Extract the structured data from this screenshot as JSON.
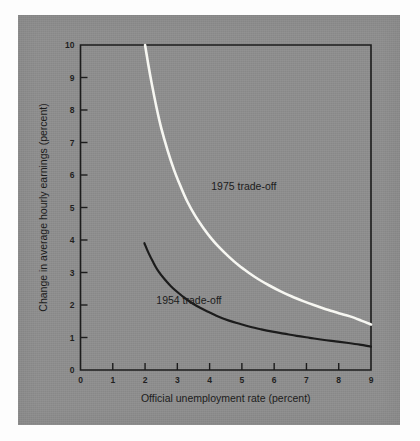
{
  "figure": {
    "panel_color": "#8e8e8e",
    "page_color": "#fdfdfd",
    "axis_color": "#1c1c1c"
  },
  "chart_data": {
    "type": "line",
    "title": "",
    "subtitle": "",
    "xlabel": "Official unemployment rate (percent)",
    "ylabel": "Change in average hourly earnings (percent)",
    "xlim": [
      0,
      9
    ],
    "ylim": [
      0,
      10
    ],
    "xticks": [
      0,
      1,
      2,
      3,
      4,
      5,
      6,
      7,
      8,
      9
    ],
    "xticklabels": [
      "0",
      "1",
      "2",
      "3",
      "4",
      "5",
      "6",
      "7",
      "8",
      "9"
    ],
    "yticks": [
      0,
      1,
      2,
      3,
      4,
      5,
      6,
      7,
      8,
      9,
      10
    ],
    "yticklabels": [
      "0",
      "1",
      "2",
      "3",
      "4",
      "5",
      "6",
      "7",
      "8",
      "9",
      "10"
    ],
    "grid": false,
    "legend_position": "inline-annotation",
    "series": [
      {
        "name": "1975 trade-off",
        "color": "#f7f7f2",
        "linewidth": 2.6,
        "label_x": 4.05,
        "label_y": 5.55,
        "x": [
          2.0,
          2.1,
          2.2,
          2.35,
          2.5,
          2.7,
          2.9,
          3.1,
          3.3,
          3.55,
          3.8,
          4.05,
          4.3,
          4.6,
          4.9,
          5.2,
          5.5,
          5.85,
          6.2,
          6.55,
          6.9,
          7.25,
          7.6,
          8.0,
          8.35,
          8.7,
          9.0
        ],
        "y": [
          10.0,
          9.4,
          8.85,
          8.1,
          7.45,
          6.75,
          6.15,
          5.65,
          5.2,
          4.75,
          4.38,
          4.05,
          3.77,
          3.48,
          3.22,
          3.0,
          2.8,
          2.6,
          2.42,
          2.26,
          2.12,
          1.99,
          1.87,
          1.75,
          1.65,
          1.52,
          1.4
        ]
      },
      {
        "name": "1954 trade-off",
        "color": "#1c1c1c",
        "linewidth": 2.2,
        "label_x": 2.35,
        "label_y": 2.02,
        "x": [
          1.98,
          2.1,
          2.25,
          2.4,
          2.6,
          2.8,
          3.0,
          3.25,
          3.5,
          3.75,
          4.0,
          4.3,
          4.6,
          4.9,
          5.25,
          5.6,
          5.95,
          6.3,
          6.7,
          7.1,
          7.5,
          7.9,
          8.3,
          8.65,
          9.0
        ],
        "y": [
          3.9,
          3.62,
          3.32,
          3.06,
          2.8,
          2.58,
          2.4,
          2.2,
          2.03,
          1.89,
          1.77,
          1.63,
          1.52,
          1.43,
          1.33,
          1.25,
          1.18,
          1.12,
          1.05,
          0.99,
          0.93,
          0.88,
          0.83,
          0.78,
          0.72
        ]
      }
    ]
  }
}
